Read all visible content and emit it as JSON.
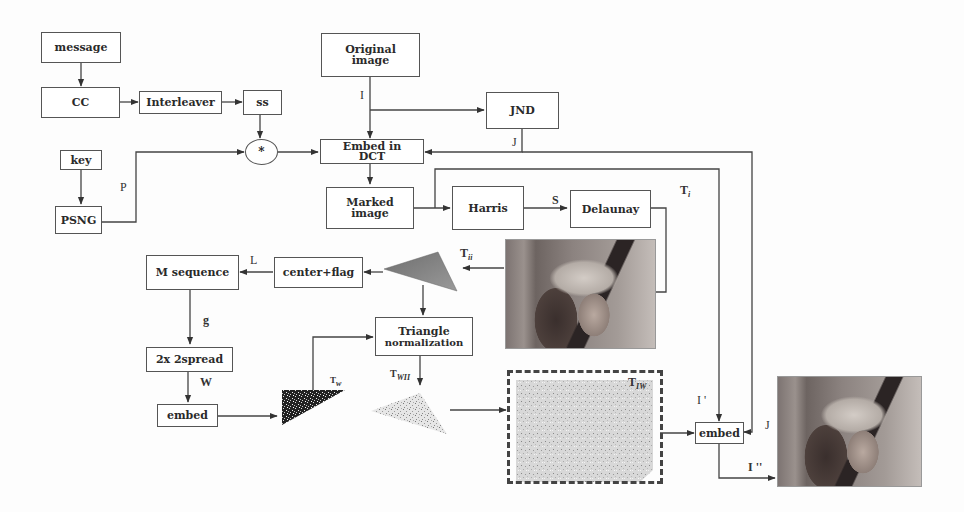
{
  "diagram": {
    "boxes": {
      "message": "message",
      "cc": "CC",
      "interleaver": "Interleaver",
      "ss": "ss",
      "key": "key",
      "psng": "PSNG",
      "multiply": "*",
      "original_image_l1": "Original",
      "original_image_l2": "image",
      "jnd": "JND",
      "embed_dct_l1": "Embed in",
      "embed_dct_l2": "DCT",
      "marked_image_l1": "Marked",
      "marked_image_l2": "image",
      "harris": "Harris",
      "delaunay": "Delaunay",
      "m_sequence": "M sequence",
      "center_flag": "center+flag",
      "triangle_norm_l1": "Triangle",
      "triangle_norm_l2": "normalization",
      "spread": "2x 2spread",
      "embed_left": "embed",
      "embed_right": "embed"
    },
    "labels": {
      "I": "I",
      "J_top": "J",
      "P": "P",
      "S": "S",
      "T": "T",
      "T_i_sub": "i",
      "T_ii_sub": "ii",
      "L": "L",
      "g": "g",
      "W": "W",
      "T_w_sub": "w",
      "T_wii_sub": "WII",
      "T_iw_sub": "IW",
      "I_prime": "I '",
      "J_right": "J",
      "I_double_prime": "I ''"
    },
    "images": {
      "lena_middle": "Lena test image (marked)",
      "lena_output": "Lena test image (watermarked output)",
      "triangle_gray": "gray triangle patch",
      "triangle_watermark": "watermark noise triangle",
      "triangle_normalized": "normalized watermark triangle",
      "watermark_field": "inverse-normalized watermark region"
    },
    "colors": {
      "line": "#444444",
      "box_border": "#555555",
      "triangle_fill": "#7a7a7a"
    }
  }
}
